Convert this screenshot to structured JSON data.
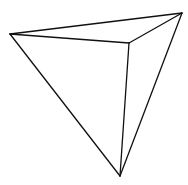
{
  "diagram": {
    "type": "wireframe-tetrahedron",
    "stroke_color": "#111111",
    "background_color": "#ffffff",
    "vertices": {
      "left": [
        10,
        34
      ],
      "top_right": [
        182,
        13
      ],
      "inner": [
        129,
        43
      ],
      "bottom": [
        120,
        176
      ]
    },
    "edges": [
      [
        "left",
        "top_right"
      ],
      [
        "left",
        "inner"
      ],
      [
        "inner",
        "top_right"
      ],
      [
        "left",
        "bottom"
      ],
      [
        "inner",
        "bottom"
      ],
      [
        "top_right",
        "bottom"
      ]
    ]
  }
}
